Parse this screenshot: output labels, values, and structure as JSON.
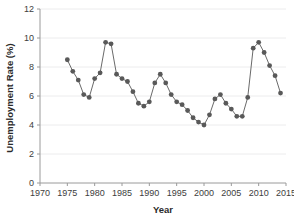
{
  "chart_data": {
    "type": "line",
    "title": "",
    "xlabel": "Year",
    "ylabel": "Unemployment Rate (%)",
    "xlim": [
      1970,
      2015
    ],
    "ylim": [
      0,
      12
    ],
    "xticks": [
      1970,
      1975,
      1980,
      1985,
      1990,
      1995,
      2000,
      2005,
      2010,
      2015
    ],
    "yticks": [
      0,
      2,
      4,
      6,
      8,
      10,
      12
    ],
    "grid": "horizontal",
    "legend": "none",
    "marker": "circle",
    "marker_color": "#595959",
    "line_color": "#6a6a6a",
    "x": [
      1975,
      1976,
      1977,
      1978,
      1979,
      1980,
      1981,
      1982,
      1983,
      1984,
      1985,
      1986,
      1987,
      1988,
      1989,
      1990,
      1991,
      1992,
      1993,
      1994,
      1995,
      1996,
      1997,
      1998,
      1999,
      2000,
      2001,
      2002,
      2003,
      2004,
      2005,
      2006,
      2007,
      2008,
      2009,
      2010,
      2011,
      2012,
      2013,
      2014
    ],
    "values": [
      8.5,
      7.7,
      7.1,
      6.1,
      5.9,
      7.2,
      7.6,
      9.7,
      9.6,
      7.5,
      7.2,
      7.0,
      6.3,
      5.5,
      5.3,
      5.6,
      6.9,
      7.5,
      6.9,
      6.1,
      5.6,
      5.4,
      5.0,
      4.5,
      4.2,
      4.0,
      4.7,
      5.8,
      6.1,
      5.5,
      5.1,
      4.6,
      4.6,
      5.9,
      9.3,
      9.7,
      9.0,
      8.1,
      7.4,
      6.2
    ],
    "ylabel_unit": "%"
  },
  "meta": {
    "plot_background": "#ffffff",
    "axis_color": "#9a9a9a",
    "grid_color": "#ececed"
  }
}
